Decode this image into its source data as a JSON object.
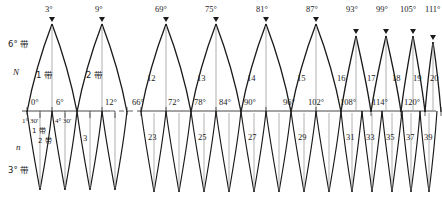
{
  "diagram": {
    "title_left": {
      "band6": "6° 带",
      "band3": "3° 带",
      "N": "N",
      "n": "n"
    },
    "left_section": {
      "top_apex_labels": [
        "3°",
        "9°"
      ],
      "zone_labels_upper": [
        "1 带",
        "2 带"
      ],
      "axis_labels": [
        "0°",
        "6°",
        "12°"
      ],
      "sub_axis_labels": [
        "1° 30'",
        "4° 30'"
      ],
      "zone_labels_lower": [
        "1 带",
        "2 带",
        "3"
      ]
    },
    "right_section": {
      "top_apex_labels": [
        "69°",
        "75°",
        "81°",
        "87°",
        "93°",
        "99°",
        "105°",
        "111°",
        "117°"
      ],
      "zone_labels_upper": [
        "12",
        "13",
        "14",
        "15",
        "16",
        "17",
        "18",
        "19",
        "20"
      ],
      "axis_labels": [
        "66°",
        "72°",
        "78°",
        "84°",
        "90°",
        "96°",
        "102°",
        "108°",
        "114°",
        "120°"
      ],
      "zone_labels_lower": [
        "23",
        "25",
        "27",
        "29",
        "31",
        "33",
        "35",
        "37",
        "39"
      ]
    },
    "break_marker": "dashed-gap",
    "colors": {
      "ink": "#1a1a1a",
      "thin": "#888888",
      "axis": "#333333"
    }
  }
}
